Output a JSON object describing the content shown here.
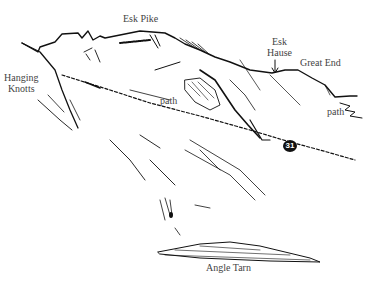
{
  "illustration": {
    "subject": "Hand-drawn fell sketch",
    "labels": {
      "esk_pike": "Esk Pike",
      "esk_hause_line1": "Esk",
      "esk_hause_line2": "Hause",
      "great_end": "Great End",
      "hanging_knotts_line1": "Hanging",
      "hanging_knotts_line2": "Knotts",
      "path_center": "path",
      "path_right": "path",
      "angle_tarn": "Angle Tarn"
    },
    "route_marker": "31",
    "colors": {
      "ink": "#111111",
      "label": "#444444",
      "background": "#ffffff"
    }
  }
}
